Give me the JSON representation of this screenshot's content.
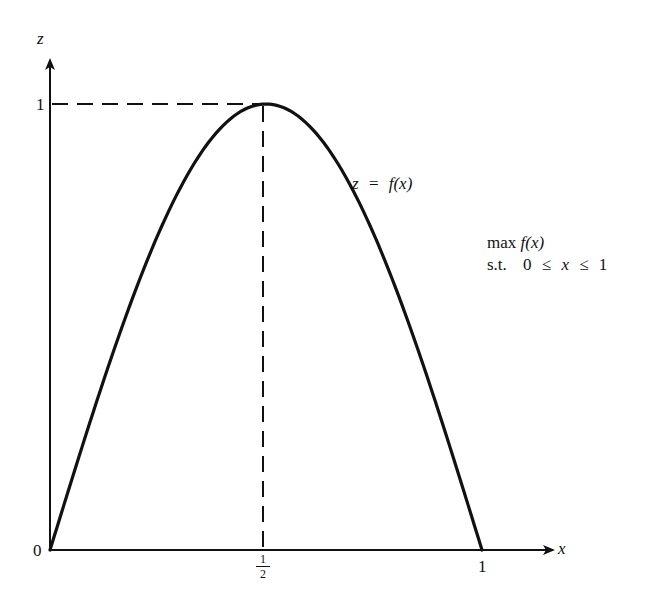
{
  "figure": {
    "axes": {
      "x_label": "x",
      "z_label": "z",
      "origin_label": "0",
      "x_ticks": [
        {
          "label_num": "1",
          "label_den": "2",
          "value": 0.5
        },
        {
          "label": "1",
          "value": 1
        }
      ],
      "z_ticks": [
        {
          "label": "1",
          "value": 1
        }
      ]
    },
    "curve": {
      "label_lhs": "z",
      "label_eq": "=",
      "label_rhs": "f(x)",
      "stroke_color": "#111111"
    },
    "guides": {
      "horizontal_dashed_at_z": 1,
      "vertical_dashed_at_x": 0.5
    },
    "problem": {
      "objective_op": "max",
      "objective_fn": "f(x)",
      "constraint_prefix": "s.t.",
      "constraint_lower": "0",
      "constraint_rel1": "≤",
      "constraint_var": "x",
      "constraint_rel2": "≤",
      "constraint_upper": "1"
    }
  },
  "chart_data": {
    "type": "line",
    "title": "",
    "xlabel": "x",
    "ylabel": "z",
    "xlim": [
      0,
      1
    ],
    "ylim": [
      0,
      1
    ],
    "grid": false,
    "series": [
      {
        "name": "z = f(x)",
        "x": [
          0,
          0.1,
          0.2,
          0.3,
          0.4,
          0.5,
          0.6,
          0.7,
          0.8,
          0.9,
          1.0
        ],
        "values": [
          0,
          0.31,
          0.59,
          0.81,
          0.95,
          1.0,
          0.95,
          0.81,
          0.59,
          0.31,
          0
        ]
      }
    ],
    "annotations": [
      "dashed line z = 1 from axis to peak",
      "dashed line x = 1/2 from peak to axis",
      "max f(x) s.t. 0 ≤ x ≤ 1"
    ]
  }
}
